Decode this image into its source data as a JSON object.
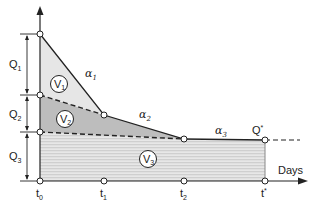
{
  "diagram": {
    "x_axis_label": "Days",
    "x_ticks": [
      {
        "main": "t",
        "sub": "0"
      },
      {
        "main": "t",
        "sub": "1"
      },
      {
        "main": "t",
        "sub": "2"
      },
      {
        "main": "t",
        "sub": "*"
      }
    ],
    "q_segments": [
      {
        "main": "Q",
        "sub": "1"
      },
      {
        "main": "Q",
        "sub": "2"
      },
      {
        "main": "Q",
        "sub": "3"
      }
    ],
    "regions": [
      {
        "main": "V",
        "sub": "1"
      },
      {
        "main": "V",
        "sub": "2"
      },
      {
        "main": "V",
        "sub": "3"
      }
    ],
    "slopes": [
      {
        "main": "α",
        "sub": "1"
      },
      {
        "main": "α",
        "sub": "2"
      },
      {
        "main": "α",
        "sub": "3"
      }
    ],
    "endpoint_label": {
      "main": "Q",
      "sup": "*"
    },
    "colors": {
      "v1_fill": "#e6e6e6",
      "v2_fill": "#bdbdbd",
      "v3_fill": "#d9d9d9",
      "v3_hatch": "#f4f4f4",
      "line": "#222222"
    }
  }
}
